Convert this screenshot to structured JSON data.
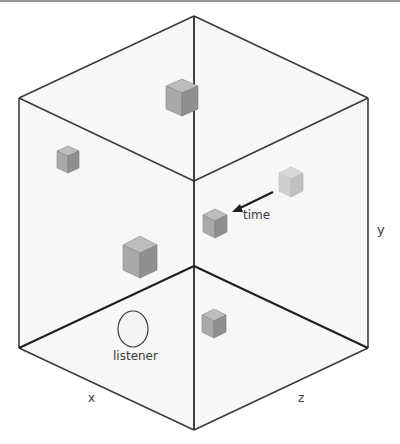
{
  "diagram": {
    "labels": {
      "x_axis": "x",
      "y_axis": "y",
      "z_axis": "z",
      "listener": "listener",
      "time": "time"
    },
    "colors": {
      "edge": "#2e2e2e",
      "face_fill": "#f6f6f6",
      "cube_top": "#b8b8b8",
      "cube_left": "#a6a6a6",
      "cube_right": "#8e8e8e",
      "cube_ghost": "#c9c9c9",
      "text": "#3a3a3a"
    },
    "sources": [
      {
        "name": "source-top-center",
        "x": 182,
        "y": 98,
        "size": 16
      },
      {
        "name": "source-upper-left",
        "x": 68,
        "y": 160,
        "size": 11
      },
      {
        "name": "source-ghost-right",
        "x": 291,
        "y": 182,
        "size": 12
      },
      {
        "name": "source-time-moved",
        "x": 215,
        "y": 223,
        "size": 12
      },
      {
        "name": "source-mid-left",
        "x": 140,
        "y": 258,
        "size": 17
      },
      {
        "name": "source-floor-right",
        "x": 214,
        "y": 324,
        "size": 12
      }
    ]
  }
}
